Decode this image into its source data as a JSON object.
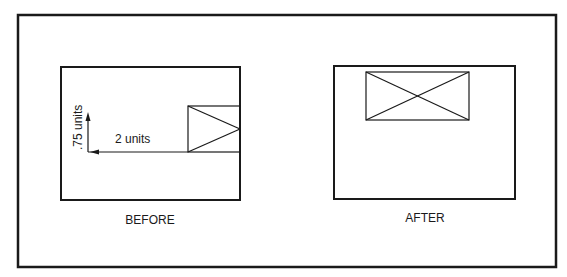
{
  "diagram": {
    "colors": {
      "stroke": "#1a1a1a",
      "background": "#ffffff"
    },
    "before": {
      "caption": "BEFORE",
      "horizontal_dimension": "2 units",
      "vertical_dimension": ".75 units"
    },
    "after": {
      "caption": "AFTER"
    }
  }
}
